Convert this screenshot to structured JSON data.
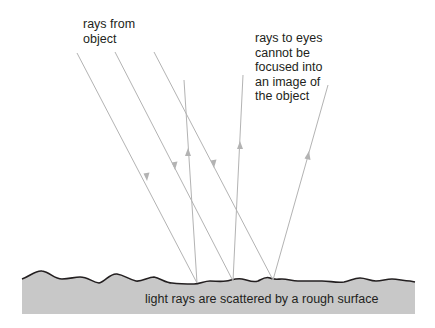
{
  "diagram": {
    "labels": {
      "incoming": "rays from\nobject",
      "outgoing": "rays to eyes\ncannot be\nfocused into\nan image of\nthe object",
      "surface": "light rays are scattered by a rough surface"
    },
    "colors": {
      "ray": "#b3b3b3",
      "surface_fill": "#c8c8c8",
      "surface_edge": "#231f20",
      "text": "#231f20",
      "background": "#ffffff"
    },
    "incident_rays": [
      {
        "from": [
          77,
          53
        ],
        "to": [
          197,
          283
        ]
      },
      {
        "from": [
          115,
          52
        ],
        "to": [
          233,
          281
        ]
      },
      {
        "from": [
          154,
          52
        ],
        "to": [
          273,
          280
        ]
      }
    ],
    "reflected_rays": [
      {
        "from": [
          197,
          283
        ],
        "to": [
          184,
          80
        ]
      },
      {
        "from": [
          233,
          281
        ],
        "to": [
          243,
          75
        ]
      },
      {
        "from": [
          273,
          280
        ],
        "to": [
          328,
          85
        ]
      }
    ],
    "surface": {
      "x_start": 22,
      "x_end": 415,
      "bottom": 314
    }
  }
}
